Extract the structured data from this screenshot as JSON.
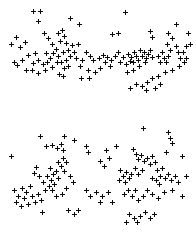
{
  "chart_data": [
    {
      "type": "scatter",
      "title": "",
      "subtitle": "",
      "xlabel": "",
      "ylabel": "",
      "panel": "top",
      "grid": false,
      "legend": null,
      "marker": "plus",
      "marker_color": "#0a0a0a",
      "marker_size_px": 5,
      "background_color": "#ffffff",
      "xlim": [
        0,
        196
      ],
      "ylim": [
        0,
        108
      ],
      "axis_visible": false,
      "tick_labels": [],
      "annotations": [],
      "n_points": 124,
      "points": [
        [
          33,
          11
        ],
        [
          40,
          11
        ],
        [
          38,
          21
        ],
        [
          70,
          18
        ],
        [
          79,
          24
        ],
        [
          125,
          12
        ],
        [
          16,
          37
        ],
        [
          25,
          42
        ],
        [
          11,
          44
        ],
        [
          20,
          47
        ],
        [
          35,
          53
        ],
        [
          44,
          33
        ],
        [
          48,
          38
        ],
        [
          52,
          44
        ],
        [
          58,
          33
        ],
        [
          62,
          30
        ],
        [
          64,
          36
        ],
        [
          60,
          41
        ],
        [
          66,
          43
        ],
        [
          56,
          49
        ],
        [
          53,
          53
        ],
        [
          58,
          56
        ],
        [
          63,
          52
        ],
        [
          68,
          50
        ],
        [
          70,
          56
        ],
        [
          72,
          45
        ],
        [
          66,
          60
        ],
        [
          61,
          62
        ],
        [
          74,
          52
        ],
        [
          76,
          58
        ],
        [
          78,
          44
        ],
        [
          68,
          66
        ],
        [
          64,
          68
        ],
        [
          57,
          62
        ],
        [
          46,
          53
        ],
        [
          50,
          58
        ],
        [
          47,
          62
        ],
        [
          52,
          67
        ],
        [
          43,
          64
        ],
        [
          38,
          60
        ],
        [
          33,
          63
        ],
        [
          28,
          55
        ],
        [
          22,
          60
        ],
        [
          17,
          65
        ],
        [
          14,
          62
        ],
        [
          26,
          70
        ],
        [
          32,
          70
        ],
        [
          38,
          73
        ],
        [
          45,
          70
        ],
        [
          59,
          74
        ],
        [
          63,
          76
        ],
        [
          80,
          66
        ],
        [
          82,
          60
        ],
        [
          86,
          52
        ],
        [
          90,
          56
        ],
        [
          93,
          60
        ],
        [
          88,
          70
        ],
        [
          81,
          78
        ],
        [
          89,
          78
        ],
        [
          95,
          72
        ],
        [
          99,
          58
        ],
        [
          103,
          55
        ],
        [
          107,
          57
        ],
        [
          111,
          60
        ],
        [
          115,
          56
        ],
        [
          118,
          52
        ],
        [
          112,
          34
        ],
        [
          118,
          33
        ],
        [
          105,
          62
        ],
        [
          100,
          68
        ],
        [
          110,
          66
        ],
        [
          120,
          62
        ],
        [
          123,
          57
        ],
        [
          128,
          54
        ],
        [
          131,
          57
        ],
        [
          134,
          52
        ],
        [
          136,
          56
        ],
        [
          130,
          61
        ],
        [
          126,
          64
        ],
        [
          133,
          62
        ],
        [
          138,
          60
        ],
        [
          142,
          56
        ],
        [
          140,
          50
        ],
        [
          144,
          52
        ],
        [
          146,
          58
        ],
        [
          148,
          54
        ],
        [
          150,
          50
        ],
        [
          152,
          57
        ],
        [
          145,
          62
        ],
        [
          139,
          66
        ],
        [
          133,
          70
        ],
        [
          127,
          72
        ],
        [
          150,
          31
        ],
        [
          152,
          37
        ],
        [
          158,
          56
        ],
        [
          162,
          52
        ],
        [
          164,
          58
        ],
        [
          160,
          62
        ],
        [
          166,
          62
        ],
        [
          168,
          56
        ],
        [
          170,
          50
        ],
        [
          167,
          44
        ],
        [
          172,
          38
        ],
        [
          176,
          46
        ],
        [
          178,
          52
        ],
        [
          180,
          58
        ],
        [
          183,
          52
        ],
        [
          186,
          46
        ],
        [
          176,
          24
        ],
        [
          168,
          33
        ],
        [
          188,
          33
        ],
        [
          190,
          44
        ],
        [
          184,
          62
        ],
        [
          179,
          66
        ],
        [
          172,
          70
        ],
        [
          165,
          72
        ],
        [
          158,
          76
        ],
        [
          152,
          78
        ],
        [
          147,
          82
        ],
        [
          142,
          86
        ],
        [
          136,
          84
        ],
        [
          130,
          88
        ],
        [
          146,
          90
        ],
        [
          155,
          88
        ],
        [
          160,
          84
        ],
        [
          186,
          58
        ]
      ]
    },
    {
      "type": "scatter",
      "title": "",
      "subtitle": "",
      "xlabel": "",
      "ylabel": "",
      "panel": "bottom",
      "grid": false,
      "legend": null,
      "marker": "plus",
      "marker_color": "#0a0a0a",
      "marker_size_px": 5,
      "background_color": "#ffffff",
      "xlim": [
        0,
        196
      ],
      "ylim": [
        0,
        115
      ],
      "axis_visible": false,
      "tick_labels": [],
      "annotations": [],
      "n_points": 118,
      "points": [
        [
          40,
          18
        ],
        [
          64,
          18
        ],
        [
          74,
          22
        ],
        [
          143,
          10
        ],
        [
          168,
          14
        ],
        [
          170,
          20
        ],
        [
          172,
          25
        ],
        [
          46,
          28
        ],
        [
          52,
          27
        ],
        [
          57,
          30
        ],
        [
          61,
          26
        ],
        [
          63,
          32
        ],
        [
          86,
          28
        ],
        [
          88,
          34
        ],
        [
          116,
          28
        ],
        [
          11,
          38
        ],
        [
          106,
          32
        ],
        [
          109,
          40
        ],
        [
          133,
          31
        ],
        [
          136,
          36
        ],
        [
          138,
          41
        ],
        [
          141,
          37
        ],
        [
          144,
          43
        ],
        [
          166,
          34
        ],
        [
          182,
          38
        ],
        [
          63,
          40
        ],
        [
          66,
          44
        ],
        [
          61,
          48
        ],
        [
          64,
          53
        ],
        [
          58,
          44
        ],
        [
          100,
          43
        ],
        [
          104,
          48
        ],
        [
          147,
          40
        ],
        [
          150,
          46
        ],
        [
          152,
          38
        ],
        [
          155,
          44
        ],
        [
          36,
          49
        ],
        [
          34,
          55
        ],
        [
          39,
          58
        ],
        [
          50,
          50
        ],
        [
          53,
          56
        ],
        [
          56,
          53
        ],
        [
          47,
          58
        ],
        [
          51,
          62
        ],
        [
          54,
          66
        ],
        [
          58,
          60
        ],
        [
          49,
          68
        ],
        [
          43,
          64
        ],
        [
          45,
          72
        ],
        [
          52,
          72
        ],
        [
          70,
          58
        ],
        [
          73,
          64
        ],
        [
          66,
          70
        ],
        [
          120,
          52
        ],
        [
          123,
          58
        ],
        [
          126,
          54
        ],
        [
          129,
          60
        ],
        [
          131,
          56
        ],
        [
          125,
          64
        ],
        [
          119,
          62
        ],
        [
          135,
          50
        ],
        [
          138,
          56
        ],
        [
          142,
          52
        ],
        [
          157,
          52
        ],
        [
          160,
          58
        ],
        [
          162,
          50
        ],
        [
          156,
          62
        ],
        [
          159,
          66
        ],
        [
          152,
          60
        ],
        [
          165,
          60
        ],
        [
          168,
          56
        ],
        [
          171,
          62
        ],
        [
          175,
          58
        ],
        [
          178,
          64
        ],
        [
          186,
          58
        ],
        [
          14,
          72
        ],
        [
          22,
          70
        ],
        [
          26,
          74
        ],
        [
          30,
          68
        ],
        [
          18,
          78
        ],
        [
          24,
          80
        ],
        [
          32,
          78
        ],
        [
          38,
          76
        ],
        [
          16,
          84
        ],
        [
          28,
          86
        ],
        [
          21,
          88
        ],
        [
          35,
          84
        ],
        [
          41,
          82
        ],
        [
          56,
          78
        ],
        [
          62,
          76
        ],
        [
          86,
          72
        ],
        [
          90,
          78
        ],
        [
          96,
          74
        ],
        [
          102,
          78
        ],
        [
          108,
          74
        ],
        [
          124,
          76
        ],
        [
          128,
          72
        ],
        [
          132,
          78
        ],
        [
          135,
          72
        ],
        [
          138,
          82
        ],
        [
          143,
          78
        ],
        [
          147,
          72
        ],
        [
          152,
          76
        ],
        [
          158,
          80
        ],
        [
          164,
          74
        ],
        [
          172,
          72
        ],
        [
          182,
          78
        ],
        [
          42,
          94
        ],
        [
          68,
          92
        ],
        [
          74,
          96
        ],
        [
          78,
          92
        ],
        [
          129,
          96
        ],
        [
          134,
          100
        ],
        [
          137,
          104
        ],
        [
          140,
          98
        ],
        [
          145,
          94
        ],
        [
          150,
          100
        ],
        [
          154,
          96
        ],
        [
          126,
          104
        ],
        [
          100,
          84
        ],
        [
          112,
          84
        ]
      ]
    }
  ],
  "figure": {
    "width_px": 196,
    "height_px": 233,
    "background_color": "#ffffff",
    "panel_count": 2
  }
}
